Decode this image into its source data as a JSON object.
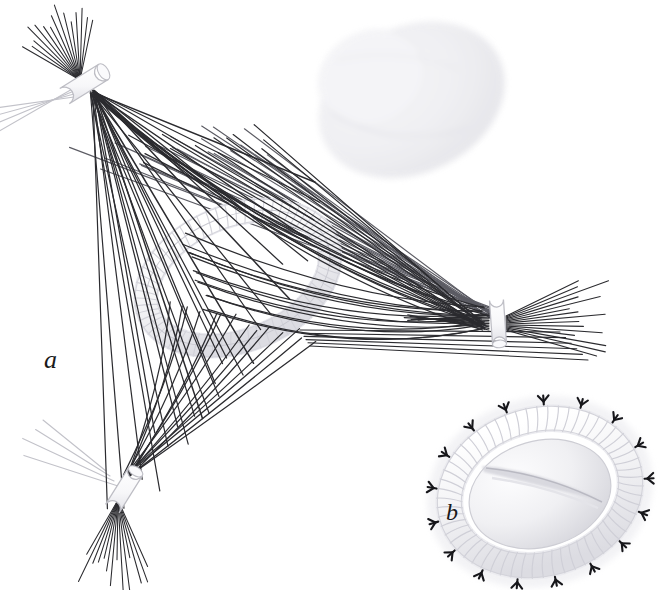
{
  "figure": {
    "background_color": "#ffffff",
    "width": 665,
    "height": 590
  },
  "panels": [
    {
      "id": "a",
      "label": "a",
      "label_x": 44,
      "label_y": 347,
      "font_size": 26,
      "description": "Spindle overview with kinetochore ring, three spindle pole bodies and microtubule bundles"
    },
    {
      "id": "b",
      "label": "b",
      "label_x": 446,
      "label_y": 500,
      "font_size": 24,
      "description": "Detail of the coiled kinetochore ring encircling a chromatid with microtubule attachment markers"
    }
  ],
  "colors": {
    "background": "#ffffff",
    "microtubule_dark": "#2b2b2f",
    "microtubule_mid": "#55555c",
    "microtubule_faint": "#b9b9bf",
    "ring_outline": "#c9c9cf",
    "ring_coil": "#d8d8de",
    "ring_shade": "#e6e6ea",
    "ghost_body": "#ededf0",
    "ghost_body_edge": "#dcdce1",
    "centriole_outline": "#bdbdc4",
    "marker_black": "#16161a",
    "label_text": "#1a1a1a",
    "chromatid_fill": "#f2f2f4",
    "chromatid_shade": "#d9d9de"
  },
  "structures": {
    "poles": [
      {
        "name": "pole-upper-left",
        "kind": "centriole",
        "cx": 84,
        "cy": 84,
        "angle_deg": -32,
        "length": 46,
        "radius": 9,
        "mt_count_fan": 16,
        "mt_count_aster": 14
      },
      {
        "name": "pole-lower-left",
        "kind": "centriole",
        "cx": 124,
        "cy": 490,
        "angle_deg": -58,
        "length": 44,
        "radius": 8,
        "mt_count_fan": 16,
        "mt_count_aster": 13
      },
      {
        "name": "pole-right",
        "kind": "centriole",
        "cx": 498,
        "cy": 322,
        "angle_deg": 86,
        "length": 44,
        "radius": 7,
        "mt_count_fan": 15,
        "mt_count_aster": 15
      }
    ],
    "ring": {
      "name": "kinetochore-ring",
      "cx": 238,
      "cy": 278,
      "rx": 96,
      "ry": 62,
      "tilt_deg": -22,
      "tube_radius": 12,
      "coil_turns": 64
    },
    "ghost_chromatin": {
      "name": "ghost-chromosome-mass",
      "cx": 412,
      "cy": 100,
      "rx": 96,
      "ry": 72,
      "tilt_deg": -26,
      "opacity": 0.5
    },
    "detail_ring": {
      "name": "detail-kinetochore-ring",
      "cx": 540,
      "cy": 492,
      "rx": 92,
      "ry": 72,
      "tilt_deg": -16,
      "tube_radius": 13,
      "coil_turns": 58,
      "marker_count": 17,
      "chromatid": {
        "rx": 68,
        "ry": 50,
        "cleft": true
      }
    },
    "bundles": [
      {
        "name": "bundle-ul-to-ring",
        "count": 14
      },
      {
        "name": "bundle-ul-to-lower",
        "count": 12
      },
      {
        "name": "bundle-right-to-upperleft",
        "count": 20
      },
      {
        "name": "bundle-ring-to-lowerleft",
        "count": 13
      },
      {
        "name": "bundle-ring-to-right",
        "count": 12
      }
    ]
  }
}
